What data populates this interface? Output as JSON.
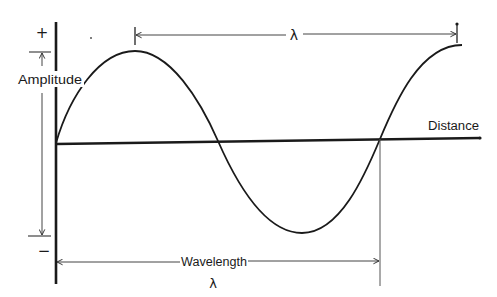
{
  "diagram": {
    "labels": {
      "plus": "+",
      "minus": "−",
      "amplitude": "Amplitude",
      "distance": "Distance",
      "wavelength": "Wavelength",
      "lambda_top": "λ",
      "lambda_bottom": "λ"
    },
    "colors": {
      "ink": "#1a1a1a",
      "thin_ink": "#444444",
      "background": "#ffffff"
    },
    "elements": {
      "vertical_axis": {
        "x": 55,
        "y1": 22,
        "y2": 284
      },
      "horizontal_axis": {
        "x1": 55,
        "y1": 144,
        "x2": 480,
        "y2": 138
      },
      "wave": {
        "start": [
          56,
          143
        ],
        "crest": [
          135,
          51
        ],
        "zero_crossing_1": [
          218,
          141
        ],
        "trough": [
          302,
          233
        ],
        "zero_crossing_2": [
          380,
          139
        ],
        "end": [
          462,
          45
        ]
      },
      "amplitude_marker": {
        "x": 42,
        "top_tick_y": 52,
        "bottom_tick_y": 236
      },
      "top_lambda_dimension": {
        "x1": 135,
        "x2": 457,
        "y": 35
      },
      "bottom_wavelength_dimension": {
        "x1": 56,
        "x2": 380,
        "y": 262
      }
    }
  }
}
